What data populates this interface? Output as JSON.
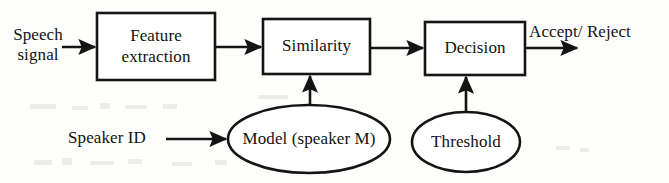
{
  "figure": {
    "stroke_color": "#141414",
    "background_color": "#fdfdfb"
  },
  "blocks": [
    {
      "id": "feature-extraction",
      "label": "Feature\nextraction",
      "shape": "rectangle"
    },
    {
      "id": "similarity",
      "label": "Similarity",
      "shape": "rectangle"
    },
    {
      "id": "decision",
      "label": "Decision",
      "shape": "rectangle"
    },
    {
      "id": "model",
      "label": "Model (speaker M)",
      "shape": "ellipse"
    },
    {
      "id": "threshold",
      "label": "Threshold",
      "shape": "ellipse"
    }
  ],
  "labels": {
    "input_signal": "Speech\nsignal",
    "speaker_id": "Speaker ID",
    "output": "Accept/ Reject"
  },
  "connections": [
    {
      "from": "speech-signal",
      "to": "feature-extraction",
      "direction": "right"
    },
    {
      "from": "feature-extraction",
      "to": "similarity",
      "direction": "right"
    },
    {
      "from": "similarity",
      "to": "decision",
      "direction": "right"
    },
    {
      "from": "decision",
      "to": "accept-reject",
      "direction": "right"
    },
    {
      "from": "speaker-id",
      "to": "model",
      "direction": "right"
    },
    {
      "from": "model",
      "to": "similarity",
      "direction": "up"
    },
    {
      "from": "threshold",
      "to": "decision",
      "direction": "up"
    }
  ]
}
